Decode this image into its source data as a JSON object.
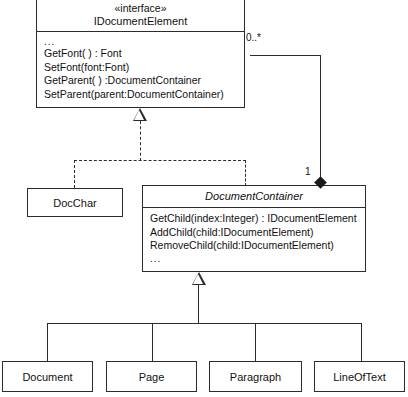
{
  "diagram": {
    "kind": "uml-class-diagram",
    "background": "#ffffff",
    "line_color": "#2b2b2b"
  },
  "interface_class": {
    "stereotype": "«interface»",
    "name": "IDocumentElement",
    "operations": [
      "...",
      "GetFont( ) : Font",
      "SetFont(font:Font)",
      "GetParent( ) :DocumentContainer",
      "SetParent(parent:DocumentContainer)"
    ]
  },
  "container_class": {
    "name": "DocumentContainer",
    "operations": [
      "GetChild(index:Integer) : IDocumentElement",
      "AddChild(child:IDocumentElement)",
      "RemoveChild(child:IDocumentElement)",
      "..."
    ]
  },
  "docchar_class": {
    "name": "DocChar"
  },
  "leaf_classes": [
    {
      "name": "Document"
    },
    {
      "name": "Page"
    },
    {
      "name": "Paragraph"
    },
    {
      "name": "LineOfText"
    }
  ],
  "association": {
    "source_multiplicity": "0..*",
    "target_multiplicity": "1"
  }
}
